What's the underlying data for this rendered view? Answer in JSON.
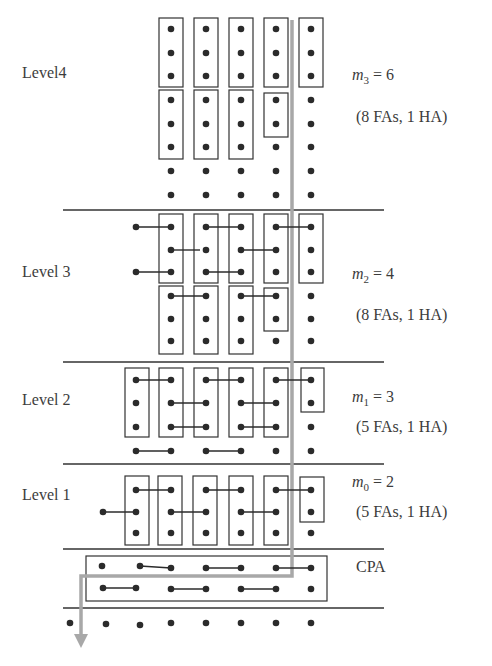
{
  "colors": {
    "dot": "#2b2b2b",
    "box": "#333333",
    "wire": "#2b2b2b",
    "divider": "#333333",
    "critical_path": "#a8a8a8",
    "text": "#3c3c3c"
  },
  "columns_x": [
    70,
    103,
    136,
    171,
    206,
    241,
    276,
    311
  ],
  "dividers_y": [
    210,
    362,
    464,
    549,
    608
  ],
  "divider_x": [
    63,
    384
  ],
  "levels": [
    {
      "name": "Level 4",
      "label": "Level4",
      "m_symbol": "m",
      "m_index": "3",
      "m_value": "6",
      "m_text": "= 6",
      "adders": "(8 FAs, 1 HA)",
      "label_pos": {
        "x": 22,
        "y": 74
      },
      "m_pos": {
        "x": 352,
        "y": 78
      },
      "note_pos": {
        "x": 356,
        "y": 118
      },
      "dots": [
        {
          "col": 171,
          "rows": [
            29,
            53,
            76,
            100,
            124,
            147,
            171,
            195
          ]
        },
        {
          "col": 206,
          "rows": [
            29,
            53,
            76,
            100,
            124,
            147,
            171,
            195
          ]
        },
        {
          "col": 241,
          "rows": [
            29,
            53,
            76,
            100,
            124,
            147,
            171,
            195
          ]
        },
        {
          "col": 276,
          "rows": [
            29,
            53,
            76,
            100,
            124,
            147,
            171,
            195
          ]
        },
        {
          "col": 311,
          "rows": [
            29,
            53,
            76,
            100,
            124,
            147,
            171,
            195
          ]
        }
      ],
      "boxes": [
        {
          "x": 159,
          "y": 18,
          "w": 24,
          "h": 69
        },
        {
          "x": 194,
          "y": 18,
          "w": 24,
          "h": 69
        },
        {
          "x": 229,
          "y": 18,
          "w": 24,
          "h": 69
        },
        {
          "x": 264,
          "y": 18,
          "w": 24,
          "h": 69
        },
        {
          "x": 299,
          "y": 18,
          "w": 24,
          "h": 69
        },
        {
          "x": 159,
          "y": 90,
          "w": 24,
          "h": 69
        },
        {
          "x": 194,
          "y": 90,
          "w": 24,
          "h": 69
        },
        {
          "x": 229,
          "y": 90,
          "w": 24,
          "h": 69
        },
        {
          "x": 264,
          "y": 93,
          "w": 24,
          "h": 44
        }
      ],
      "wires": []
    },
    {
      "name": "Level 3",
      "label": "Level 3",
      "m_symbol": "m",
      "m_index": "2",
      "m_value": "4",
      "m_text": "= 4",
      "adders": "(8 FAs, 1 HA)",
      "label_pos": {
        "x": 22,
        "y": 273
      },
      "m_pos": {
        "x": 352,
        "y": 277
      },
      "note_pos": {
        "x": 356,
        "y": 316
      },
      "dots": [
        {
          "col": 136,
          "rows": [
            227,
            272
          ]
        },
        {
          "col": 171,
          "rows": [
            227,
            250,
            272,
            296,
            319,
            341
          ]
        },
        {
          "col": 206,
          "rows": [
            227,
            250,
            272,
            296,
            319,
            341
          ]
        },
        {
          "col": 241,
          "rows": [
            227,
            250,
            272,
            296,
            319,
            341
          ]
        },
        {
          "col": 276,
          "rows": [
            227,
            250,
            272,
            296,
            319,
            341
          ]
        },
        {
          "col": 311,
          "rows": [
            227,
            250,
            272,
            296,
            319,
            341
          ]
        }
      ],
      "boxes": [
        {
          "x": 159,
          "y": 214,
          "w": 24,
          "h": 69
        },
        {
          "x": 194,
          "y": 214,
          "w": 24,
          "h": 69
        },
        {
          "x": 229,
          "y": 214,
          "w": 24,
          "h": 69
        },
        {
          "x": 264,
          "y": 214,
          "w": 24,
          "h": 69
        },
        {
          "x": 299,
          "y": 214,
          "w": 24,
          "h": 69
        },
        {
          "x": 159,
          "y": 286,
          "w": 24,
          "h": 68
        },
        {
          "x": 194,
          "y": 286,
          "w": 24,
          "h": 68
        },
        {
          "x": 229,
          "y": 286,
          "w": 24,
          "h": 68
        },
        {
          "x": 264,
          "y": 288,
          "w": 24,
          "h": 43
        }
      ],
      "wires": [
        {
          "x1": 136,
          "y1": 227,
          "x2": 171,
          "y2": 227
        },
        {
          "x1": 136,
          "y1": 272,
          "x2": 171,
          "y2": 272
        },
        {
          "x1": 171,
          "y1": 250,
          "x2": 200,
          "y2": 250
        },
        {
          "x1": 206,
          "y1": 227,
          "x2": 241,
          "y2": 227
        },
        {
          "x1": 206,
          "y1": 272,
          "x2": 241,
          "y2": 272
        },
        {
          "x1": 241,
          "y1": 250,
          "x2": 276,
          "y2": 250
        },
        {
          "x1": 276,
          "y1": 227,
          "x2": 311,
          "y2": 227
        },
        {
          "x1": 171,
          "y1": 296,
          "x2": 206,
          "y2": 296
        },
        {
          "x1": 241,
          "y1": 296,
          "x2": 276,
          "y2": 296
        }
      ]
    },
    {
      "name": "Level 2",
      "label": "Level 2",
      "m_symbol": "m",
      "m_index": "1",
      "m_value": "3",
      "m_text": "= 3",
      "adders": "(5 FAs, 1 HA)",
      "label_pos": {
        "x": 22,
        "y": 401
      },
      "m_pos": {
        "x": 352,
        "y": 400
      },
      "note_pos": {
        "x": 356,
        "y": 428
      },
      "dots": [
        {
          "col": 136,
          "rows": [
            380,
            403,
            427,
            451
          ]
        },
        {
          "col": 171,
          "rows": [
            380,
            403,
            427,
            451
          ]
        },
        {
          "col": 206,
          "rows": [
            380,
            403,
            427,
            451
          ]
        },
        {
          "col": 241,
          "rows": [
            380,
            403,
            427,
            451
          ]
        },
        {
          "col": 276,
          "rows": [
            380,
            403,
            427,
            451
          ]
        },
        {
          "col": 311,
          "rows": [
            380,
            403,
            427,
            451
          ]
        }
      ],
      "boxes": [
        {
          "x": 125,
          "y": 368,
          "w": 24,
          "h": 69
        },
        {
          "x": 159,
          "y": 368,
          "w": 24,
          "h": 69
        },
        {
          "x": 194,
          "y": 368,
          "w": 24,
          "h": 69
        },
        {
          "x": 229,
          "y": 368,
          "w": 24,
          "h": 69
        },
        {
          "x": 264,
          "y": 368,
          "w": 24,
          "h": 69
        },
        {
          "x": 301,
          "y": 368,
          "w": 23,
          "h": 44
        }
      ],
      "wires": [
        {
          "x1": 136,
          "y1": 380,
          "x2": 171,
          "y2": 380
        },
        {
          "x1": 171,
          "y1": 403,
          "x2": 206,
          "y2": 403
        },
        {
          "x1": 171,
          "y1": 427,
          "x2": 206,
          "y2": 427
        },
        {
          "x1": 206,
          "y1": 380,
          "x2": 241,
          "y2": 380
        },
        {
          "x1": 241,
          "y1": 403,
          "x2": 276,
          "y2": 403
        },
        {
          "x1": 241,
          "y1": 427,
          "x2": 276,
          "y2": 427
        },
        {
          "x1": 276,
          "y1": 380,
          "x2": 311,
          "y2": 380
        },
        {
          "x1": 136,
          "y1": 451,
          "x2": 171,
          "y2": 451
        },
        {
          "x1": 206,
          "y1": 451,
          "x2": 241,
          "y2": 451
        }
      ]
    },
    {
      "name": "Level 1",
      "label": "Level 1",
      "m_symbol": "m",
      "m_index": "0",
      "m_value": "2",
      "m_text": "= 2",
      "adders": "(5 FAs, 1 HA)",
      "label_pos": {
        "x": 22,
        "y": 496
      },
      "m_pos": {
        "x": 352,
        "y": 485
      },
      "note_pos": {
        "x": 356,
        "y": 513
      },
      "dots": [
        {
          "col": 103,
          "rows": [
            512
          ]
        },
        {
          "col": 136,
          "rows": [
            490,
            512,
            533
          ]
        },
        {
          "col": 171,
          "rows": [
            490,
            512,
            533
          ]
        },
        {
          "col": 206,
          "rows": [
            490,
            512,
            533
          ]
        },
        {
          "col": 241,
          "rows": [
            490,
            512,
            533
          ]
        },
        {
          "col": 276,
          "rows": [
            490,
            512,
            533
          ]
        },
        {
          "col": 311,
          "rows": [
            490,
            512,
            533
          ]
        }
      ],
      "boxes": [
        {
          "x": 125,
          "y": 476,
          "w": 24,
          "h": 69
        },
        {
          "x": 158,
          "y": 476,
          "w": 24,
          "h": 69
        },
        {
          "x": 193,
          "y": 476,
          "w": 24,
          "h": 69
        },
        {
          "x": 229,
          "y": 476,
          "w": 24,
          "h": 69
        },
        {
          "x": 264,
          "y": 476,
          "w": 24,
          "h": 69
        },
        {
          "x": 300,
          "y": 477,
          "w": 24,
          "h": 45
        }
      ],
      "wires": [
        {
          "x1": 103,
          "y1": 512,
          "x2": 136,
          "y2": 512
        },
        {
          "x1": 136,
          "y1": 490,
          "x2": 171,
          "y2": 490
        },
        {
          "x1": 171,
          "y1": 512,
          "x2": 206,
          "y2": 512
        },
        {
          "x1": 206,
          "y1": 490,
          "x2": 241,
          "y2": 490
        },
        {
          "x1": 241,
          "y1": 512,
          "x2": 276,
          "y2": 512
        },
        {
          "x1": 276,
          "y1": 490,
          "x2": 311,
          "y2": 490
        }
      ]
    }
  ],
  "cpa": {
    "label": "CPA",
    "label_pos": {
      "x": 356,
      "y": 568
    },
    "box": {
      "x": 86,
      "y": 556,
      "w": 241,
      "h": 45
    },
    "dots": [
      {
        "x": 102,
        "y": 566
      },
      {
        "x": 140,
        "y": 566
      },
      {
        "x": 171,
        "y": 568
      },
      {
        "x": 206,
        "y": 568
      },
      {
        "x": 241,
        "y": 568
      },
      {
        "x": 276,
        "y": 568
      },
      {
        "x": 311,
        "y": 568
      },
      {
        "x": 103,
        "y": 588
      },
      {
        "x": 136,
        "y": 588
      },
      {
        "x": 171,
        "y": 589
      },
      {
        "x": 206,
        "y": 589
      },
      {
        "x": 241,
        "y": 589
      },
      {
        "x": 276,
        "y": 589
      },
      {
        "x": 311,
        "y": 589
      }
    ],
    "wires": [
      {
        "x1": 140,
        "y1": 566,
        "x2": 171,
        "y2": 568
      },
      {
        "x1": 206,
        "y1": 568,
        "x2": 241,
        "y2": 568
      },
      {
        "x1": 276,
        "y1": 568,
        "x2": 311,
        "y2": 568
      },
      {
        "x1": 103,
        "y1": 588,
        "x2": 136,
        "y2": 588
      },
      {
        "x1": 171,
        "y1": 589,
        "x2": 206,
        "y2": 589
      },
      {
        "x1": 241,
        "y1": 589,
        "x2": 276,
        "y2": 589
      }
    ]
  },
  "output_dots": [
    {
      "x": 70,
      "y": 623
    },
    {
      "x": 106,
      "y": 624
    },
    {
      "x": 140,
      "y": 625
    },
    {
      "x": 171,
      "y": 623
    },
    {
      "x": 206,
      "y": 623
    },
    {
      "x": 241,
      "y": 623
    },
    {
      "x": 276,
      "y": 623
    },
    {
      "x": 311,
      "y": 623
    }
  ],
  "critical_path": {
    "points": [
      [
        292,
        20
      ],
      [
        292,
        576
      ],
      [
        81,
        576
      ],
      [
        81,
        636
      ]
    ],
    "arrow_tip": {
      "x": 81,
      "y": 648
    }
  }
}
